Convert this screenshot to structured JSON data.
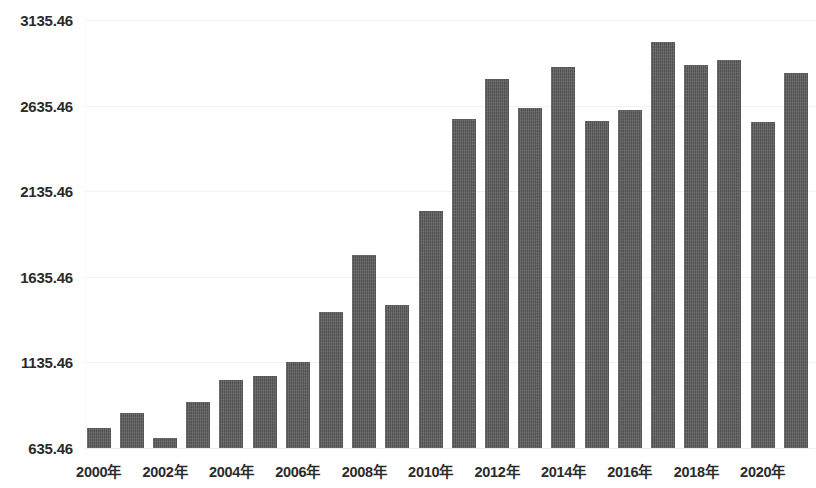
{
  "chart_data": {
    "type": "bar",
    "title": "",
    "subtitle": "",
    "xlabel": "",
    "ylabel": "",
    "grid": true,
    "legend": null,
    "legend_position": "none",
    "bar_color": "#5a5a5a",
    "background_color": "#ffffff",
    "gridline_color": "#f2f2f2",
    "label_color": "#2b2b2b",
    "ylim": [
      635.46,
      3135.46
    ],
    "y_ticks": [
      635.46,
      1135.46,
      1635.46,
      2135.46,
      2635.46,
      3135.46
    ],
    "y_tick_labels": [
      "635.46",
      "1135.46",
      "1635.46",
      "2135.46",
      "2635.46",
      "3135.46"
    ],
    "x_tick_labels": [
      "2000年",
      "2002年",
      "2004年",
      "2006年",
      "2008年",
      "2010年",
      "2012年",
      "2014年",
      "2016年",
      "2018年",
      "2020年"
    ],
    "x_tick_indices": [
      0,
      2,
      4,
      6,
      8,
      10,
      12,
      14,
      16,
      18,
      20
    ],
    "categories": [
      "2000年",
      "2001年",
      "2002年",
      "2003年",
      "2004年",
      "2005年",
      "2006年",
      "2007年",
      "2008年",
      "2009年",
      "2010年",
      "2011年",
      "2012年",
      "2013年",
      "2014年",
      "2015年",
      "2016年",
      "2017年",
      "2018年",
      "2019年",
      "2020年",
      "2021年"
    ],
    "values": [
      752,
      839,
      693,
      903,
      1032,
      1055,
      1137,
      1429,
      1763,
      1470,
      2020,
      2557,
      2790,
      2621,
      2860,
      2545,
      2610,
      3006,
      2872,
      2901,
      2540,
      2825
    ]
  }
}
